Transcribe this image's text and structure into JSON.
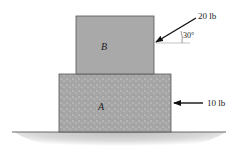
{
  "diagram": {
    "block_top": {
      "label": "B"
    },
    "block_bottom": {
      "label": "A"
    },
    "force_inclined": {
      "magnitude": "20 lb",
      "angle": "30°"
    },
    "force_horizontal": {
      "magnitude": "10 lb"
    },
    "colors": {
      "block_b": "#a9a9a9",
      "block_a": "#a4a4a4",
      "ground": "#c8c8c8",
      "outline": "#555555"
    }
  }
}
